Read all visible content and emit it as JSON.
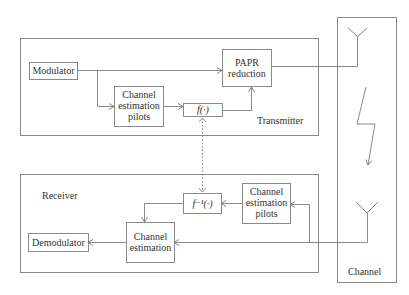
{
  "diagram": {
    "sections": {
      "transmitter": "Transmitter",
      "receiver": "Receiver",
      "channel": "Channel"
    },
    "transmitter_blocks": {
      "modulator": "Modulator",
      "pilots": [
        "Channel",
        "estimation",
        "pilots"
      ],
      "f": "f(·)",
      "papr": [
        "PAPR",
        "reduction"
      ]
    },
    "receiver_blocks": {
      "pilots": [
        "Channel",
        "estimation",
        "pilots"
      ],
      "f_inverse": "f⁻¹(·)",
      "channel_estimation": [
        "Channel",
        "estimation"
      ],
      "demodulator": "Demodulator"
    },
    "colors": {
      "line": "#8a8a8a",
      "box": "#7a7a7a",
      "text": "#333333"
    }
  }
}
